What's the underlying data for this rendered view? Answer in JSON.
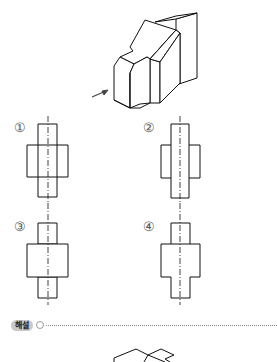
{
  "question": {
    "figure": "isometric-3d-block",
    "view_arrow": "front-view-direction-arrow"
  },
  "options": [
    {
      "label": "①",
      "shape": "cross-with-inner-vertical-lines"
    },
    {
      "label": "②",
      "shape": "tall-rect-with-side-rects"
    },
    {
      "label": "③",
      "shape": "three-stacked-rects"
    },
    {
      "label": "④",
      "shape": "stepped-outline"
    }
  ],
  "explanation": {
    "label": "해설",
    "icon": "circle-bullet-icon"
  }
}
